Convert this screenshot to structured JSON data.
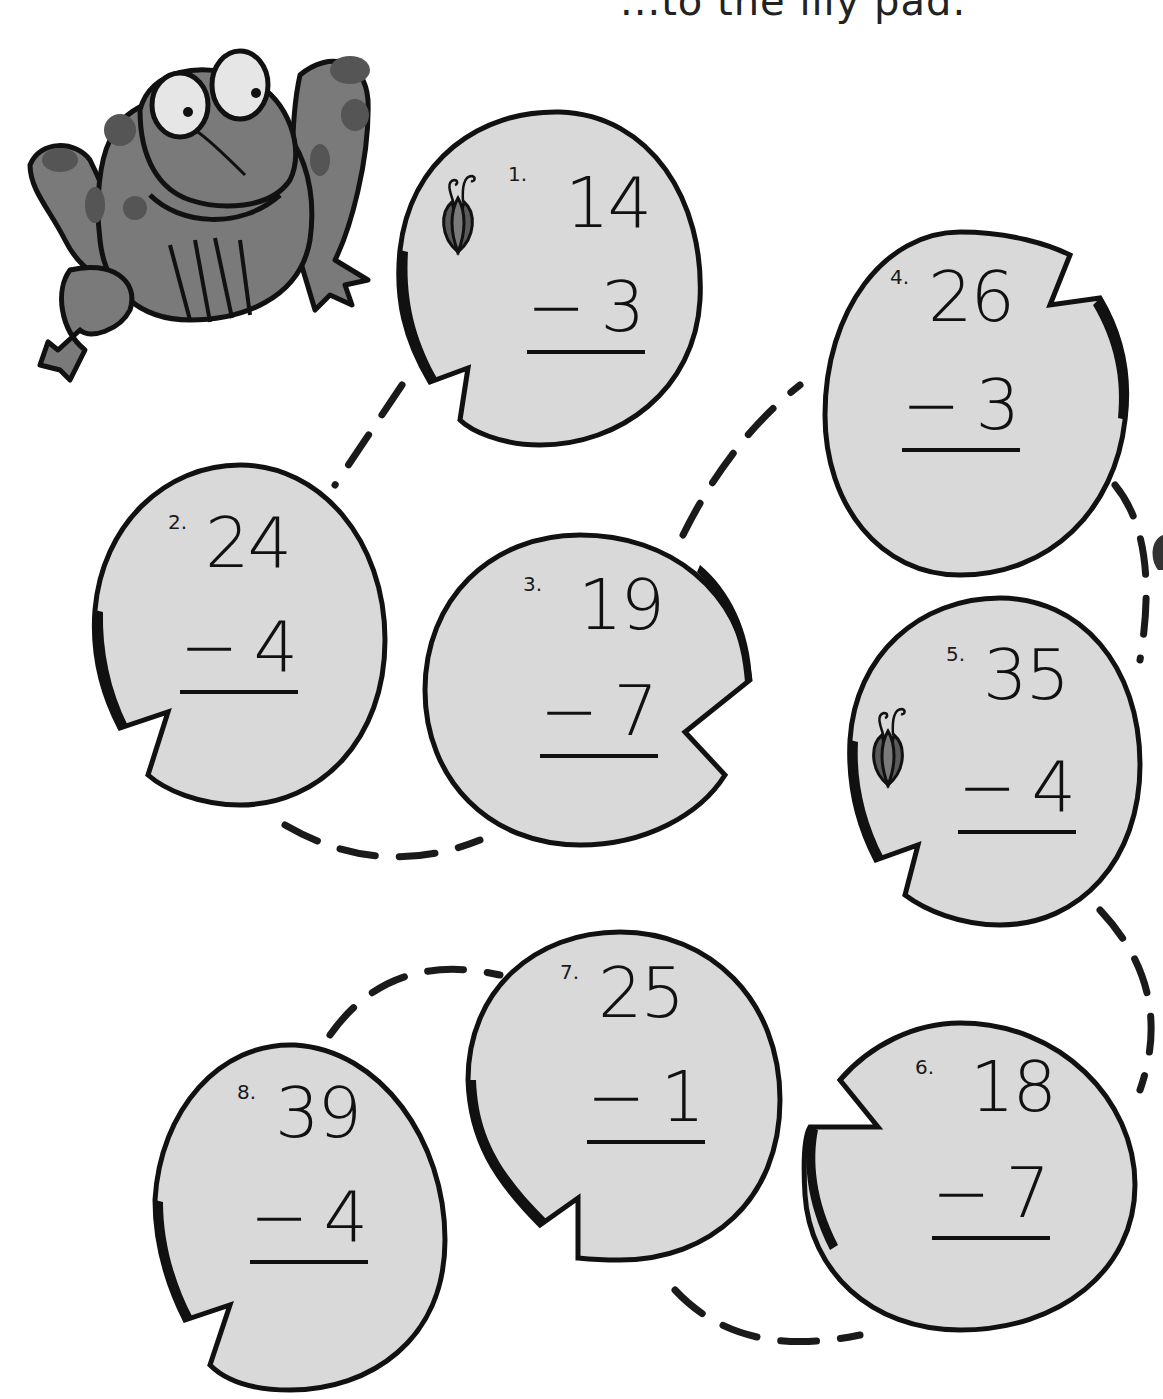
{
  "worksheet": {
    "heading_partial": "...to the lily pad.",
    "colors": {
      "pad_fill": "#d9d9d9",
      "outline": "#111111",
      "frog_body": "#7a7a7a",
      "frog_spots": "#4f4f4f",
      "lotus": "#6b6b6b"
    },
    "problems": [
      {
        "number": "1.",
        "top": "14",
        "operator": "−",
        "bottom": "3",
        "has_lotus": true
      },
      {
        "number": "2.",
        "top": "24",
        "operator": "−",
        "bottom": "4",
        "has_lotus": false
      },
      {
        "number": "3.",
        "top": "19",
        "operator": "−",
        "bottom": "7",
        "has_lotus": false
      },
      {
        "number": "4.",
        "top": "26",
        "operator": "−",
        "bottom": "3",
        "has_lotus": false
      },
      {
        "number": "5.",
        "top": "35",
        "operator": "−",
        "bottom": "4",
        "has_lotus": true
      },
      {
        "number": "6.",
        "top": "18",
        "operator": "−",
        "bottom": "7",
        "has_lotus": false
      },
      {
        "number": "7.",
        "top": "25",
        "operator": "−",
        "bottom": "1",
        "has_lotus": false
      },
      {
        "number": "8.",
        "top": "39",
        "operator": "−",
        "bottom": "4",
        "has_lotus": false
      }
    ],
    "path_order": [
      "1",
      "2",
      "3",
      "4",
      "5",
      "6",
      "7",
      "8"
    ],
    "illustration": "frog-icon"
  }
}
